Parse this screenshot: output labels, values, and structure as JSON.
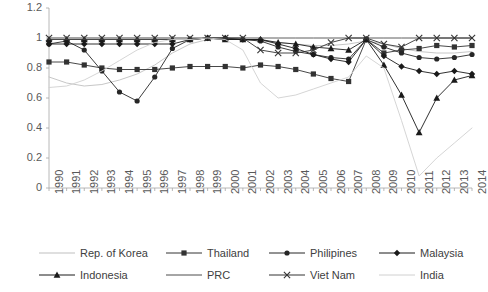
{
  "chart_data": {
    "type": "line",
    "title": "",
    "xlabel": "",
    "ylabel": "",
    "grid": false,
    "legend_position": "bottom",
    "ylim": [
      0,
      1.2
    ],
    "yticks": [
      "0",
      "0.2",
      "0.4",
      "0.6",
      "0.8",
      "1",
      "1.2"
    ],
    "ytick_values": [
      0,
      0.2,
      0.4,
      0.6,
      0.8,
      1,
      1.2
    ],
    "categories": [
      "1990",
      "1991",
      "1992",
      "1993",
      "1994",
      "1995",
      "1996",
      "1997",
      "1998",
      "1999",
      "2000",
      "2001",
      "2002",
      "2003",
      "2004",
      "2005",
      "2006",
      "2007",
      "2008",
      "2009",
      "2010",
      "2011",
      "2012",
      "2013",
      "2014"
    ],
    "series": [
      {
        "name": "Rep. of Korea",
        "marker": "none",
        "color": "#BFBFBF",
        "values": [
          0.74,
          0.7,
          0.68,
          0.69,
          0.72,
          0.76,
          0.82,
          0.9,
          0.96,
          0.99,
          1.0,
          0.99,
          0.98,
          0.97,
          0.96,
          0.95,
          0.95,
          0.96,
          0.98,
          0.96,
          0.93,
          0.91,
          0.9,
          0.9,
          0.91
        ]
      },
      {
        "name": "Thailand",
        "marker": "square",
        "color": "#333333",
        "values": [
          0.84,
          0.84,
          0.82,
          0.8,
          0.79,
          0.79,
          0.79,
          0.8,
          0.81,
          0.81,
          0.81,
          0.8,
          0.82,
          0.81,
          0.79,
          0.76,
          0.73,
          0.71,
          0.99,
          0.9,
          0.92,
          0.93,
          0.95,
          0.94,
          0.95
        ]
      },
      {
        "name": "Philipines",
        "marker": "circle",
        "color": "#262626",
        "values": [
          0.96,
          0.98,
          0.92,
          0.78,
          0.64,
          0.58,
          0.74,
          0.93,
          0.99,
          1.0,
          0.99,
          0.99,
          0.98,
          0.94,
          0.91,
          0.89,
          0.87,
          0.86,
          0.99,
          0.94,
          0.9,
          0.87,
          0.86,
          0.87,
          0.89
        ]
      },
      {
        "name": "Malaysia",
        "marker": "diamond",
        "color": "#1A1A1A",
        "values": [
          0.96,
          0.96,
          0.96,
          0.96,
          0.96,
          0.96,
          0.96,
          0.96,
          0.99,
          1.0,
          1.0,
          0.99,
          0.99,
          0.96,
          0.93,
          0.89,
          0.86,
          0.84,
          0.99,
          0.88,
          0.81,
          0.78,
          0.76,
          0.78,
          0.76
        ]
      },
      {
        "name": "Indonesia",
        "marker": "triangle",
        "color": "#1A1A1A",
        "values": [
          0.99,
          0.99,
          0.99,
          0.99,
          0.99,
          0.99,
          0.99,
          0.99,
          0.99,
          1.0,
          0.99,
          0.99,
          0.99,
          0.97,
          0.96,
          0.94,
          0.93,
          0.92,
          0.99,
          0.82,
          0.62,
          0.37,
          0.6,
          0.72,
          0.75
        ]
      },
      {
        "name": "PRC",
        "marker": "none",
        "color": "#4D4D4D",
        "values": [
          0.99,
          0.99,
          0.99,
          0.99,
          0.99,
          0.99,
          0.99,
          0.99,
          0.99,
          1.0,
          1.0,
          1.0,
          1.0,
          1.0,
          1.0,
          1.0,
          1.0,
          1.0,
          1.0,
          1.0,
          1.0,
          1.0,
          1.0,
          1.0,
          1.0
        ]
      },
      {
        "name": "Viet Nam",
        "marker": "cross",
        "color": "#333333",
        "values": [
          1.0,
          1.0,
          1.0,
          1.0,
          1.0,
          1.0,
          1.0,
          1.0,
          1.0,
          1.0,
          1.0,
          1.0,
          0.92,
          0.9,
          0.9,
          0.92,
          0.97,
          1.0,
          1.0,
          0.96,
          0.94,
          1.0,
          1.0,
          1.0,
          1.0
        ]
      },
      {
        "name": "India",
        "marker": "none",
        "color": "#D0D0D0",
        "values": [
          0.67,
          0.68,
          0.72,
          0.78,
          0.85,
          0.92,
          0.97,
          0.99,
          0.99,
          1.0,
          0.99,
          0.92,
          0.7,
          0.6,
          0.62,
          0.66,
          0.7,
          0.74,
          0.88,
          0.8,
          0.45,
          0.08,
          0.2,
          0.3,
          0.4
        ]
      }
    ]
  },
  "legend": {
    "items": [
      {
        "label": "Rep. of Korea",
        "marker": "none",
        "color": "#BFBFBF"
      },
      {
        "label": "Thailand",
        "marker": "square",
        "color": "#333333"
      },
      {
        "label": "Philipines",
        "marker": "circle",
        "color": "#262626"
      },
      {
        "label": "Malaysia",
        "marker": "diamond",
        "color": "#1A1A1A"
      },
      {
        "label": "Indonesia",
        "marker": "triangle",
        "color": "#1A1A1A"
      },
      {
        "label": "PRC",
        "marker": "none",
        "color": "#4D4D4D"
      },
      {
        "label": "Viet Nam",
        "marker": "cross",
        "color": "#333333"
      },
      {
        "label": "India",
        "marker": "none",
        "color": "#D0D0D0"
      }
    ]
  },
  "axis": {
    "tick_color": "#595959",
    "line_color": "#A6A6A6"
  }
}
